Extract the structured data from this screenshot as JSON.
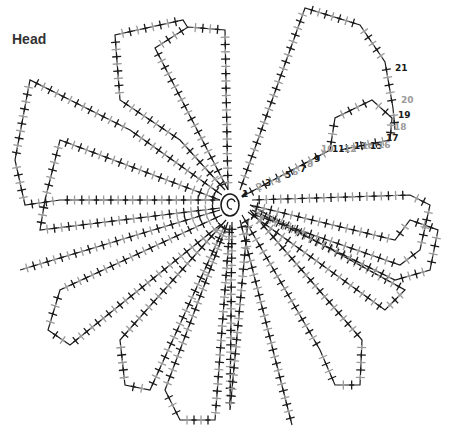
{
  "diagram": {
    "title": "Head",
    "type": "crochet-chart",
    "colors": {
      "odd_round": "#1a1a1a",
      "even_round": "#9a9a9a",
      "background": "#ffffff"
    },
    "center": {
      "symbol": "magic-ring-spiral",
      "x": 230,
      "y": 205
    },
    "round_labels": [
      {
        "text": "1",
        "x": 242,
        "y": 197,
        "color": "#1a1a1a"
      },
      {
        "text": "2",
        "x": 256,
        "y": 190,
        "color": "#9a9a9a"
      },
      {
        "text": "3",
        "x": 265,
        "y": 186,
        "color": "#1a1a1a"
      },
      {
        "text": "4",
        "x": 275,
        "y": 183,
        "color": "#9a9a9a"
      },
      {
        "text": "5",
        "x": 285,
        "y": 178,
        "color": "#1a1a1a"
      },
      {
        "text": "6",
        "x": 292,
        "y": 175,
        "color": "#9a9a9a"
      },
      {
        "text": "7",
        "x": 300,
        "y": 172,
        "color": "#1a1a1a"
      },
      {
        "text": "8",
        "x": 307,
        "y": 167,
        "color": "#9a9a9a"
      },
      {
        "text": "9",
        "x": 314,
        "y": 162,
        "color": "#1a1a1a"
      },
      {
        "text": "10",
        "x": 321,
        "y": 152,
        "color": "#9a9a9a"
      },
      {
        "text": "11",
        "x": 332,
        "y": 152,
        "color": "#1a1a1a"
      },
      {
        "text": "12",
        "x": 344,
        "y": 152,
        "color": "#9a9a9a"
      },
      {
        "text": "13",
        "x": 354,
        "y": 149,
        "color": "#1a1a1a"
      },
      {
        "text": "14",
        "x": 362,
        "y": 149,
        "color": "#9a9a9a"
      },
      {
        "text": "15",
        "x": 370,
        "y": 149,
        "color": "#1a1a1a"
      },
      {
        "text": "16",
        "x": 378,
        "y": 148,
        "color": "#9a9a9a"
      },
      {
        "text": "17",
        "x": 386,
        "y": 141,
        "color": "#1a1a1a"
      },
      {
        "text": "18",
        "x": 394,
        "y": 130,
        "color": "#9a9a9a"
      },
      {
        "text": "19",
        "x": 398,
        "y": 118,
        "color": "#1a1a1a"
      },
      {
        "text": "20",
        "x": 401,
        "y": 103,
        "color": "#9a9a9a"
      },
      {
        "text": "21",
        "x": 395,
        "y": 71,
        "color": "#1a1a1a"
      }
    ],
    "petals": [
      {
        "name": "top-left-outer",
        "points": [
          [
            225,
            190
          ],
          [
            180,
            140
          ],
          [
            120,
            100
          ],
          [
            115,
            35
          ],
          [
            183,
            20
          ],
          [
            188,
            28
          ]
        ]
      },
      {
        "name": "top-center",
        "points": [
          [
            228,
            190
          ],
          [
            155,
            48
          ],
          [
            188,
            27
          ],
          [
            225,
            30
          ],
          [
            228,
            190
          ]
        ]
      },
      {
        "name": "top-right",
        "points": [
          [
            240,
            190
          ],
          [
            305,
            8
          ],
          [
            360,
            25
          ],
          [
            385,
            62
          ],
          [
            393,
            108
          ],
          [
            395,
            130
          ]
        ]
      },
      {
        "name": "upper-left",
        "points": [
          [
            222,
            195
          ],
          [
            130,
            130
          ],
          [
            30,
            80
          ],
          [
            15,
            160
          ],
          [
            25,
            205
          ],
          [
            60,
            200
          ],
          [
            220,
            200
          ]
        ]
      },
      {
        "name": "left",
        "points": [
          [
            220,
            200
          ],
          [
            60,
            140
          ],
          [
            45,
            200
          ],
          [
            40,
            230
          ],
          [
            220,
            208
          ]
        ]
      },
      {
        "name": "left-lower",
        "points": [
          [
            220,
            210
          ],
          [
            20,
            270
          ]
        ]
      },
      {
        "name": "lower-left-loop",
        "points": [
          [
            222,
            215
          ],
          [
            60,
            290
          ],
          [
            48,
            330
          ],
          [
            70,
            345
          ],
          [
            220,
            225
          ]
        ]
      },
      {
        "name": "bottom-left",
        "points": [
          [
            226,
            220
          ],
          [
            120,
            340
          ],
          [
            125,
            385
          ],
          [
            150,
            390
          ],
          [
            225,
            225
          ]
        ]
      },
      {
        "name": "bottom-center-left",
        "points": [
          [
            228,
            222
          ],
          [
            165,
            390
          ],
          [
            180,
            420
          ],
          [
            215,
            420
          ],
          [
            230,
            225
          ]
        ]
      },
      {
        "name": "bottom-center",
        "points": [
          [
            232,
            222
          ],
          [
            230,
            410
          ],
          [
            248,
            220
          ]
        ]
      },
      {
        "name": "bottom-right",
        "points": [
          [
            240,
            220
          ],
          [
            292,
            425
          ]
        ]
      },
      {
        "name": "lower-right-loop",
        "points": [
          [
            242,
            215
          ],
          [
            320,
            350
          ],
          [
            335,
            385
          ],
          [
            360,
            385
          ],
          [
            362,
            340
          ],
          [
            250,
            210
          ]
        ]
      },
      {
        "name": "right-lower",
        "points": [
          [
            248,
            212
          ],
          [
            385,
            310
          ],
          [
            405,
            290
          ],
          [
            250,
            205
          ]
        ]
      },
      {
        "name": "right",
        "points": [
          [
            250,
            205
          ],
          [
            395,
            240
          ],
          [
            410,
            220
          ],
          [
            438,
            230
          ],
          [
            430,
            270
          ],
          [
            395,
            280
          ],
          [
            252,
            210
          ]
        ]
      },
      {
        "name": "right-upper",
        "points": [
          [
            252,
            200
          ],
          [
            410,
            195
          ],
          [
            430,
            205
          ],
          [
            420,
            250
          ],
          [
            400,
            265
          ],
          [
            255,
            215
          ]
        ]
      },
      {
        "name": "upper-right-numbered",
        "points": [
          [
            245,
            195
          ],
          [
            330,
            150
          ],
          [
            335,
            118
          ],
          [
            372,
            100
          ],
          [
            392,
            118
          ],
          [
            390,
            140
          ],
          [
            340,
            150
          ]
        ]
      }
    ]
  }
}
